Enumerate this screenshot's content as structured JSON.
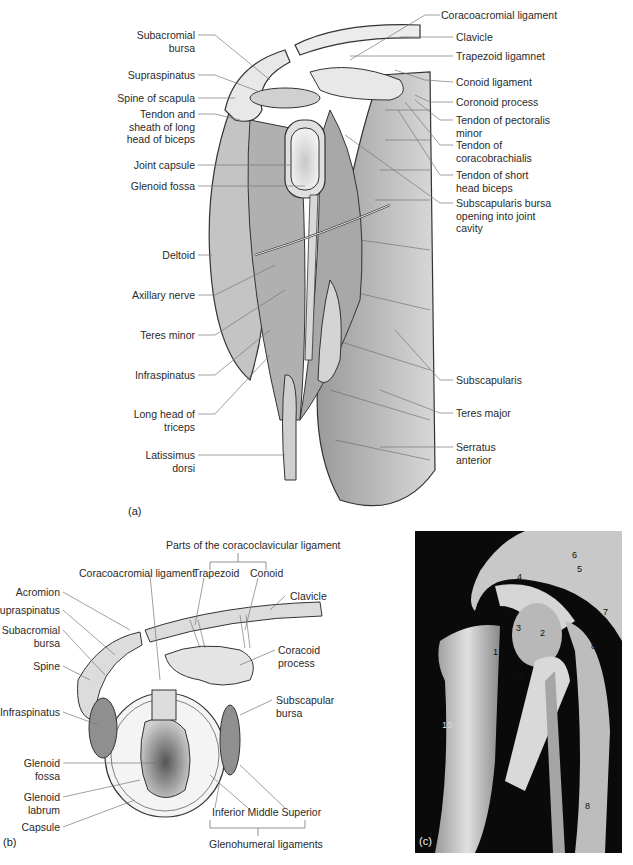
{
  "figure_a": {
    "panel_label": "(a)",
    "left_labels": [
      {
        "text": "Subacromial\nbursa"
      },
      {
        "text": "Supraspinatus"
      },
      {
        "text": "Spine of scapula"
      },
      {
        "text": "Tendon and\nsheath of long\nhead of biceps"
      },
      {
        "text": "Joint capsule"
      },
      {
        "text": "Glenoid fossa"
      },
      {
        "text": "Deltoid"
      },
      {
        "text": "Axillary nerve"
      },
      {
        "text": "Teres minor"
      },
      {
        "text": "Infraspinatus"
      },
      {
        "text": "Long head of\ntriceps"
      },
      {
        "text": "Latissimus\ndorsi"
      }
    ],
    "right_labels": [
      {
        "text": "Coracoacromial ligament"
      },
      {
        "text": "Clavicle"
      },
      {
        "text": "Trapezoid ligamnet"
      },
      {
        "text": "Conoid ligament"
      },
      {
        "text": "Coronoid process"
      },
      {
        "text": "Tendon of pectoralis\nminor"
      },
      {
        "text": "Tendon of\ncoracobrachialis"
      },
      {
        "text": "Tendon of short\nhead biceps"
      },
      {
        "text": "Subscapularis bursa\nopening into joint\ncavity"
      },
      {
        "text": "Subscapularis"
      },
      {
        "text": "Teres major"
      },
      {
        "text": "Serratus\nanterior"
      }
    ]
  },
  "figure_b": {
    "panel_label": "(b)",
    "group_top": "Parts of the coracoclavicular ligament",
    "top_labels": [
      {
        "text": "Coracoacromial ligament"
      },
      {
        "text": "Trapezoid"
      },
      {
        "text": "Conoid"
      }
    ],
    "left_labels": [
      {
        "text": "Acromion"
      },
      {
        "text": "Supraspinatus"
      },
      {
        "text": "Subacromial\nbursa"
      },
      {
        "text": "Spine"
      },
      {
        "text": "Infraspinatus"
      },
      {
        "text": "Glenoid\nfossa"
      },
      {
        "text": "Glenoid\nlabrum"
      },
      {
        "text": "Capsule"
      }
    ],
    "right_labels": [
      {
        "text": "Clavicle"
      },
      {
        "text": "Coracoid\nprocess"
      },
      {
        "text": "Subscapular\nbursa"
      }
    ],
    "bottom_labels": "Inferior Middle Superior",
    "group_bottom": "Glenohumeral ligaments"
  },
  "figure_c": {
    "panel_label": "(c)",
    "markers": [
      "1",
      "2",
      "3",
      "4",
      "5",
      "6",
      "7",
      "8",
      "1",
      "9",
      "10",
      "8"
    ]
  },
  "colors": {
    "muscle": "#bdbdbd",
    "bone": "#e6e6e6",
    "outline": "#333333",
    "photo_bg": "#0a0a0a",
    "leader": "#777777"
  }
}
